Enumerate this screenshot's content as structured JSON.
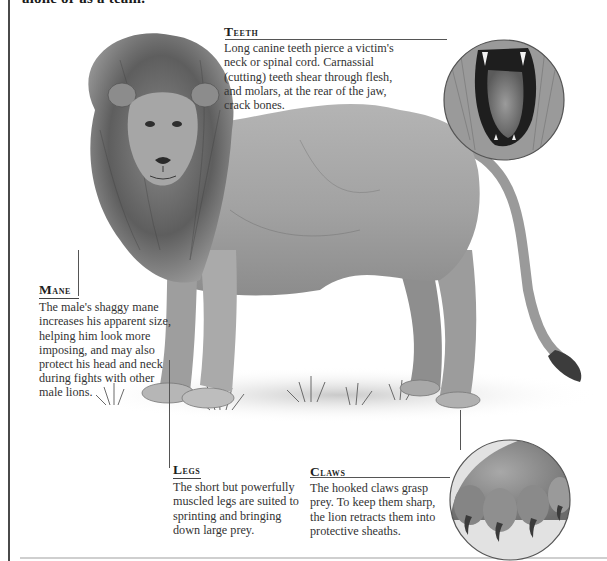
{
  "page": {
    "top_partial_text": "alone or as a team.",
    "colors": {
      "text": "#2a2a2a",
      "rule": "#444444",
      "left_border": "#4a4a4a",
      "bottom_rule": "#cfcfcf"
    }
  },
  "illustration": {
    "subject": "male lion standing, side view with head turned to viewer",
    "insets": [
      {
        "name": "teeth-inset",
        "depicts": "open lion jaw showing canine teeth and tongue"
      },
      {
        "name": "claws-inset",
        "depicts": "lion paw with extended hooked claws"
      }
    ]
  },
  "callouts": {
    "teeth": {
      "heading": "Teeth",
      "lines": [
        "Long canine teeth pierce a victim's",
        "neck or spinal cord. Carnassial",
        "(cutting) teeth shear through flesh,",
        "and molars, at the rear of the jaw,",
        "crack bones."
      ]
    },
    "mane": {
      "heading": "Mane",
      "lines": [
        "The male's shaggy mane",
        "increases his apparent size,",
        "helping him look more",
        "imposing, and may also",
        "protect his head and neck",
        "during fights with other",
        "male lions."
      ]
    },
    "legs": {
      "heading": "Legs",
      "lines": [
        "The short but powerfully",
        "muscled legs are suited to",
        "sprinting and bringing",
        "down large prey."
      ]
    },
    "claws": {
      "heading": "Claws",
      "lines": [
        "The hooked claws grasp",
        "prey. To keep them sharp,",
        "the lion retracts them into",
        "protective sheaths."
      ]
    }
  }
}
